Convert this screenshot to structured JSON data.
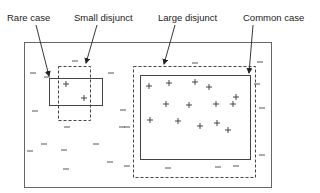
{
  "diagram": {
    "labels": {
      "rare_case": "Rare case",
      "small_disjunct": "Small disjunct",
      "large_disjunct": "Large disjunct",
      "common_case": "Common case"
    },
    "symbols": {
      "positive": "+",
      "negative": "–"
    },
    "colors": {
      "stroke": "#555555",
      "text": "#222222",
      "background": "#ffffff"
    },
    "outer_region": {
      "x": 24,
      "y": 42,
      "w": 247,
      "h": 145
    },
    "rare_case_box": {
      "x": 49,
      "y": 78,
      "w": 53,
      "h": 27,
      "style": "solid"
    },
    "small_disjunct_box": {
      "x": 58,
      "y": 66,
      "w": 32,
      "h": 54,
      "style": "dashed"
    },
    "large_disjunct_box": {
      "x": 133,
      "y": 66,
      "w": 122,
      "h": 111,
      "style": "dashed"
    },
    "common_case_box": {
      "x": 140,
      "y": 75,
      "w": 110,
      "h": 84,
      "style": "solid"
    },
    "positives": [
      [
        66,
        84
      ],
      [
        84,
        98
      ],
      [
        149,
        86
      ],
      [
        169,
        83
      ],
      [
        195,
        82
      ],
      [
        209,
        87
      ],
      [
        236,
        97
      ],
      [
        166,
        104
      ],
      [
        189,
        105
      ],
      [
        216,
        104
      ],
      [
        233,
        104
      ],
      [
        150,
        120
      ],
      [
        178,
        121
      ],
      [
        200,
        126
      ],
      [
        217,
        123
      ],
      [
        228,
        130
      ]
    ],
    "negatives": [
      [
        75,
        61
      ],
      [
        33,
        73
      ],
      [
        47,
        77
      ],
      [
        111,
        73
      ],
      [
        123,
        110
      ],
      [
        35,
        111
      ],
      [
        122,
        127
      ],
      [
        67,
        127
      ],
      [
        44,
        144
      ],
      [
        30,
        151
      ],
      [
        64,
        150
      ],
      [
        96,
        144
      ],
      [
        66,
        169
      ],
      [
        110,
        162
      ],
      [
        127,
        166
      ],
      [
        195,
        63
      ],
      [
        260,
        62
      ],
      [
        262,
        108
      ],
      [
        262,
        155
      ],
      [
        168,
        168
      ],
      [
        218,
        167
      ],
      [
        236,
        166
      ],
      [
        257,
        84
      ],
      [
        127,
        127
      ]
    ]
  }
}
